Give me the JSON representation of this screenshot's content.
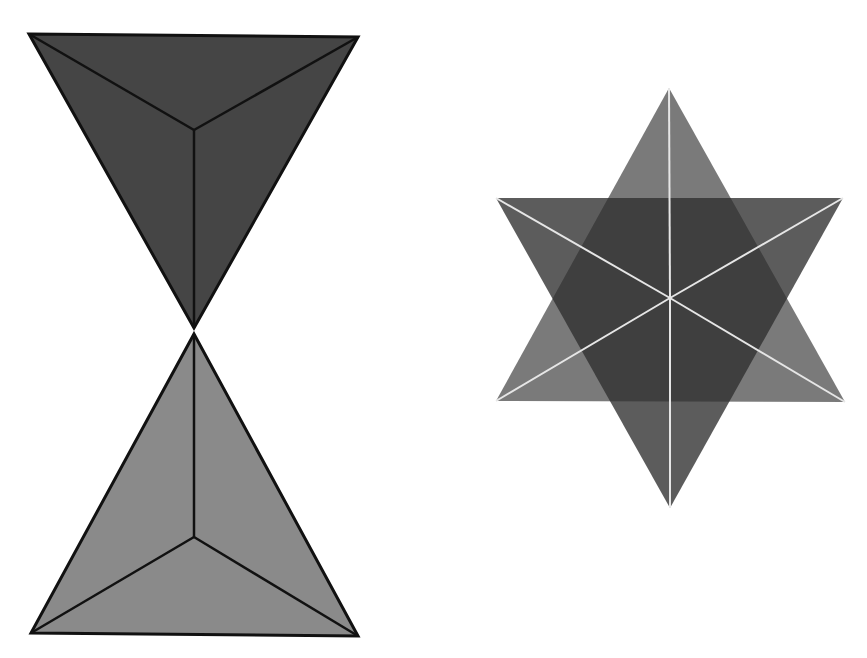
{
  "figure": {
    "background": "#ffffff",
    "left_figure": {
      "name": "hourglass-tetrahedra",
      "description": "Two tetrahedra viewed along an axis, tip to tip",
      "upper": {
        "fill": "#444444",
        "stroke": "#111111",
        "outline": [
          [
            29,
            34
          ],
          [
            358,
            37
          ],
          [
            194,
            328
          ]
        ],
        "center": [
          194,
          130
        ]
      },
      "lower": {
        "fill": "#888888",
        "stroke": "#111111",
        "outline": [
          [
            194,
            334
          ],
          [
            358,
            636
          ],
          [
            31,
            633
          ]
        ],
        "center": [
          194,
          537
        ]
      }
    },
    "right_figure": {
      "name": "star-tetrahedron",
      "description": "Two overlapping triangles forming a six-pointed star with white edge lines",
      "down_triangle": {
        "fill": "#333333",
        "opacity": 0.85,
        "outline": [
          [
            496,
            198
          ],
          [
            843,
            198
          ],
          [
            670,
            508
          ]
        ]
      },
      "up_triangle": {
        "fill": "#777777",
        "opacity": 0.9,
        "outline": [
          [
            669,
            88
          ],
          [
            845,
            402
          ],
          [
            496,
            401
          ]
        ]
      },
      "center": [
        670,
        298
      ],
      "edge_color": "#dddddd"
    }
  }
}
